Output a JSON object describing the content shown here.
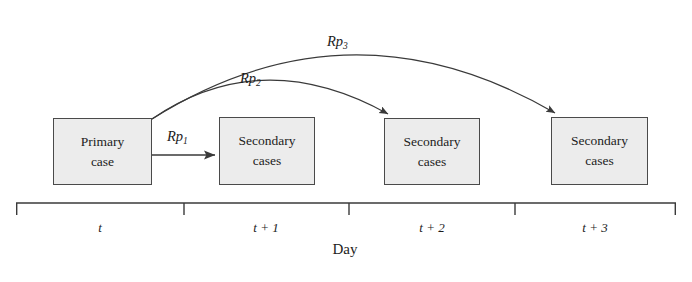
{
  "figure": {
    "type": "diagram",
    "background_color": "#ffffff",
    "box_fill_color": "#ececec",
    "box_border_color": "#4a4a4a",
    "stroke_color": "#3a3a3a"
  },
  "boxes": [
    {
      "id": "primary-case",
      "line1": "Primary",
      "line2": "case",
      "x": 53,
      "y": 118,
      "w": 99,
      "h": 67
    },
    {
      "id": "secondary-cases-t1",
      "line1": "Secondary",
      "line2": "cases",
      "x": 219,
      "y": 117,
      "w": 96,
      "h": 68
    },
    {
      "id": "secondary-cases-t2",
      "line1": "Secondary",
      "line2": "cases",
      "x": 384,
      "y": 118,
      "w": 96,
      "h": 67
    },
    {
      "id": "secondary-cases-t3",
      "line1": "Secondary",
      "line2": "cases",
      "x": 551,
      "y": 117,
      "w": 97,
      "h": 68
    }
  ],
  "arrows": [
    {
      "id": "rp1",
      "label_base": "Rp",
      "label_sub": "1",
      "label_x": 167,
      "label_y": 128,
      "kind": "straight",
      "from": {
        "x": 152,
        "y": 155
      },
      "to": {
        "x": 219,
        "y": 155
      }
    },
    {
      "id": "rp2",
      "label_base": "Rp",
      "label_sub": "2",
      "label_x": 240,
      "label_y": 70,
      "kind": "curve",
      "from": {
        "x": 152,
        "y": 119
      },
      "to": {
        "x": 391,
        "y": 117
      },
      "control": {
        "x": 262,
        "y": 58
      }
    },
    {
      "id": "rp3",
      "label_base": "Rp",
      "label_sub": "3",
      "label_x": 327,
      "label_y": 33,
      "kind": "curve",
      "from": {
        "x": 152,
        "y": 119
      },
      "to": {
        "x": 558,
        "y": 116
      },
      "control": {
        "x": 348,
        "y": 12
      }
    }
  ],
  "axis": {
    "title": "Day",
    "title_x": 345,
    "title_y": 241,
    "line_y": 203,
    "tick_bottom_y": 215,
    "x_start": 16,
    "x_end": 676,
    "tick_positions": [
      16,
      184,
      349,
      515,
      676
    ],
    "ticks": [
      {
        "label": "t",
        "center_x": 100,
        "label_y": 220
      },
      {
        "label": "t + 1",
        "center_x": 266,
        "label_y": 220
      },
      {
        "label": "t + 2",
        "center_x": 432,
        "label_y": 220
      },
      {
        "label": "t + 3",
        "center_x": 595,
        "label_y": 220
      }
    ]
  }
}
